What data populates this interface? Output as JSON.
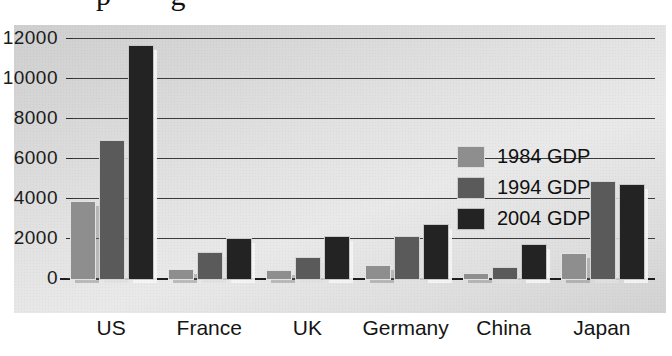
{
  "title_remnant": "p          g",
  "chart_data": {
    "type": "bar",
    "title": "",
    "xlabel": "",
    "ylabel": "",
    "categories": [
      "US",
      "France",
      "UK",
      "Germany",
      "China",
      "Japan"
    ],
    "series": [
      {
        "name": "1984 GDP",
        "color": "#8e8e8e",
        "values": [
          3850,
          450,
          400,
          670,
          250,
          1270
        ]
      },
      {
        "name": "1994 GDP",
        "color": "#5a5a5a",
        "values": [
          6900,
          1280,
          1030,
          2080,
          550,
          4850
        ]
      },
      {
        "name": "2004 GDP",
        "color": "#232323",
        "values": [
          11650,
          1980,
          2120,
          2720,
          1700,
          4680
        ]
      }
    ],
    "ylim": [
      0,
      12000
    ],
    "yticks": [
      0,
      2000,
      4000,
      6000,
      8000,
      10000,
      12000
    ],
    "ytick_labels": [
      "0",
      "2000",
      "4000",
      "6000",
      "8000",
      "10000",
      "12000"
    ],
    "grid": true,
    "legend_position": "upper-right-inside"
  },
  "legend": {
    "items": [
      {
        "label": "1984 GDP",
        "color": "#8e8e8e"
      },
      {
        "label": "1994 GDP",
        "color": "#5a5a5a"
      },
      {
        "label": "2004 GDP",
        "color": "#232323"
      }
    ]
  }
}
